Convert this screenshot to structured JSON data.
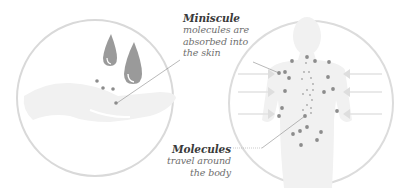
{
  "diagram": {
    "left_panel": {
      "description": "hand with oil drops",
      "drops": 2,
      "dots": 4
    },
    "right_panel": {
      "description": "human body silhouette with molecules and inward arrows",
      "arrows_left": 3,
      "arrows_right": 3
    },
    "callouts": {
      "top": {
        "title": "Miniscule",
        "lines": [
          "molecules are",
          "absorbed into",
          "the skin"
        ]
      },
      "bottom": {
        "title": "Molecules",
        "lines": [
          "travel around",
          "the body"
        ]
      }
    },
    "colors": {
      "circle_stroke": "#d9d9d9",
      "fill_light": "#f2f2f2",
      "drop": "#9a9a9a",
      "dot": "#8c8c8c",
      "leader_line": "#8a8a8a",
      "arrow": "#e2e2e2"
    }
  }
}
